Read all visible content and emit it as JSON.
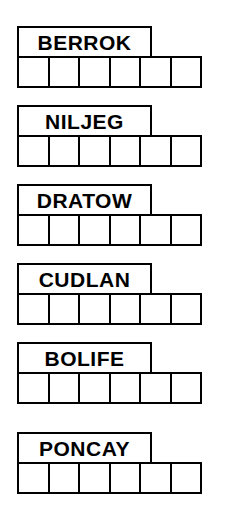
{
  "sheet": {
    "title": "word-shape-puzzle",
    "ink_color": "#000000",
    "paper_color": "#ffffff",
    "cells_per_row": 6,
    "label_span_cells": 4
  },
  "rows": [
    {
      "word": "BERROK",
      "letters": 6,
      "marked_cells": [
        3,
        4
      ],
      "cells": [
        "",
        "",
        "",
        "",
        "",
        ""
      ]
    },
    {
      "word": "NILJEG",
      "letters": 6,
      "marked_cells": [
        4,
        5
      ],
      "cells": [
        "",
        "",
        "",
        "",
        "",
        ""
      ]
    },
    {
      "word": "DRATOW",
      "letters": 6,
      "marked_cells": [
        1,
        2
      ],
      "cells": [
        "",
        "",
        "",
        "",
        "",
        ""
      ]
    },
    {
      "word": "CUDLAN",
      "letters": 6,
      "marked_cells": [
        4,
        5
      ],
      "cells": [
        "",
        "",
        "",
        "",
        "",
        ""
      ]
    },
    {
      "word": "BOLIFE",
      "letters": 6,
      "marked_cells": [
        1,
        2,
        5
      ],
      "cells": [
        "",
        "",
        "",
        "",
        "",
        ""
      ]
    },
    {
      "word": "PONCAY",
      "letters": 6,
      "marked_cells": [
        5
      ],
      "cells": [
        "",
        "",
        "",
        "",
        "",
        ""
      ]
    }
  ]
}
